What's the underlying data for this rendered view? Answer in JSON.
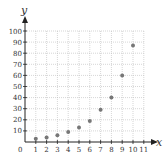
{
  "chart_data": {
    "type": "scatter",
    "title": "",
    "xlabel": "x",
    "ylabel": "y",
    "x": [
      1,
      2,
      3,
      4,
      5,
      6,
      7,
      8,
      9,
      10
    ],
    "y": [
      3,
      4,
      6,
      9,
      13,
      19,
      29,
      40,
      60,
      87
    ],
    "xlim": [
      0,
      11
    ],
    "ylim": [
      0,
      100
    ],
    "x_ticks": [
      1,
      2,
      3,
      4,
      5,
      6,
      7,
      8,
      9,
      10,
      11
    ],
    "y_ticks": [
      10,
      20,
      30,
      40,
      50,
      60,
      70,
      80,
      90,
      100
    ],
    "origin_label": "0",
    "grid": true,
    "legend": null,
    "colors": {
      "points": "#777777",
      "axes": "#222222",
      "grid": "#bbbbbb",
      "text": "#333333"
    }
  }
}
